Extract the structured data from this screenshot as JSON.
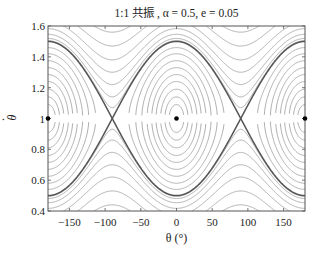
{
  "chart_data": {
    "type": "line",
    "subtype": "phase-portrait",
    "title": "1:1 共振 , α = 0.5, e = 0.05",
    "xlabel": "θ (°)",
    "ylabel": "θ̇",
    "xlim": [
      -180,
      180
    ],
    "ylim": [
      0.4,
      1.6
    ],
    "xticks": [
      -150,
      -100,
      -50,
      0,
      50,
      100,
      150
    ],
    "xtick_labels": [
      "−150",
      "−100",
      "−50",
      "0",
      "50",
      "100",
      "150"
    ],
    "yticks": [
      0.4,
      0.6,
      0.8,
      1.0,
      1.2,
      1.4,
      1.6
    ],
    "ytick_labels": [
      "0.4",
      "0.6",
      "0.8",
      "1",
      "1.2",
      "1.4",
      "1.6"
    ],
    "grid": false,
    "legend": null,
    "equilibria": {
      "stable_centers": [
        {
          "theta": -180,
          "thetadot": 1.0
        },
        {
          "theta": 0,
          "thetadot": 1.0
        },
        {
          "theta": 180,
          "thetadot": 1.0
        }
      ],
      "saddles": [
        {
          "theta": -90,
          "thetadot": 1.0
        },
        {
          "theta": 90,
          "thetadot": 1.0
        }
      ]
    },
    "separatrix": {
      "center_thetadot": 1.0,
      "max_half_width": 0.5,
      "max_at_theta": [
        -180,
        0,
        180
      ],
      "zero_width_at_theta": [
        -90,
        90
      ]
    },
    "model": {
      "resonance_amplitude_K": 0.0625,
      "potential_period_deg": 180
    },
    "libration_levels": [
      0.09,
      0.14,
      0.19,
      0.24,
      0.285,
      0.33,
      0.375,
      0.42,
      0.46
    ],
    "circulation_levels": [
      0.07,
      0.14,
      0.22,
      0.3,
      0.38,
      0.47,
      0.56,
      0.65,
      0.74
    ],
    "colors": {
      "orbits": "#9a9a9a",
      "separatrix": "#555555",
      "points": "#000000",
      "axes": "#555555"
    }
  }
}
